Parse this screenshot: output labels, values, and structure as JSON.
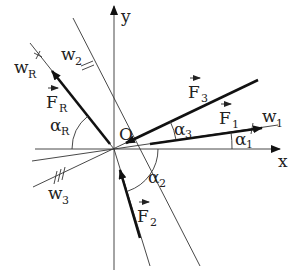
{
  "diagram": {
    "origin_label": "O",
    "axes": {
      "x_label": "x",
      "y_label": "y"
    },
    "vectors": [
      {
        "name": "F",
        "sub": "1",
        "line": "w",
        "line_sub": "1",
        "angle": "α",
        "angle_sub": "1"
      },
      {
        "name": "F",
        "sub": "2",
        "angle": "α",
        "angle_sub": "2",
        "line": "w",
        "line_sub": "2"
      },
      {
        "name": "F",
        "sub": "3",
        "line": "w",
        "line_sub": "3",
        "angle": "α",
        "angle_sub": "3"
      },
      {
        "name": "F",
        "sub": "R",
        "line": "w",
        "line_sub": "R",
        "angle": "α",
        "angle_sub": "R"
      }
    ],
    "colors": {
      "line": "#333333",
      "vector": "#111111",
      "background": "#ffffff"
    }
  }
}
